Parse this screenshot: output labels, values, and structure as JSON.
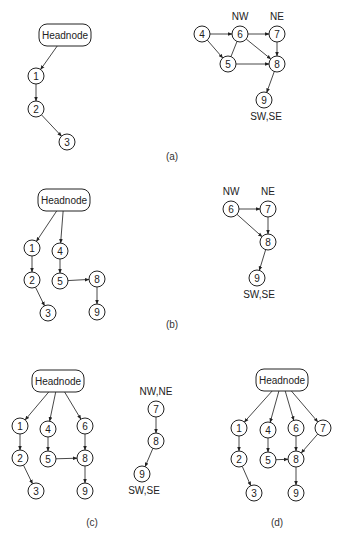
{
  "panels": [
    {
      "id": "a",
      "caption": "(a)",
      "graphs": [
        {
          "nodes": [
            {
              "id": "H",
              "label": "Headnode",
              "type": "head"
            },
            {
              "id": "1",
              "label": "1"
            },
            {
              "id": "2",
              "label": "2"
            },
            {
              "id": "3",
              "label": "3"
            }
          ],
          "edges": [
            [
              "H",
              "1",
              true
            ],
            [
              "1",
              "2",
              true
            ],
            [
              "2",
              "3",
              true
            ]
          ]
        },
        {
          "nodes": [
            {
              "id": "4",
              "label": "4"
            },
            {
              "id": "6",
              "label": "6",
              "tag": "NW"
            },
            {
              "id": "7",
              "label": "7",
              "tag": "NE"
            },
            {
              "id": "5",
              "label": "5"
            },
            {
              "id": "8",
              "label": "8"
            },
            {
              "id": "9",
              "label": "9",
              "tag": "SW,SE"
            }
          ],
          "edges": [
            [
              "4",
              "6",
              true
            ],
            [
              "4",
              "5",
              true
            ],
            [
              "6",
              "7",
              true
            ],
            [
              "5",
              "6",
              false
            ],
            [
              "6",
              "8",
              true
            ],
            [
              "5",
              "8",
              true
            ],
            [
              "7",
              "8",
              true
            ],
            [
              "8",
              "9",
              true
            ]
          ]
        }
      ]
    },
    {
      "id": "b",
      "caption": "(b)",
      "graphs": [
        {
          "nodes": [
            {
              "id": "H",
              "label": "Headnode",
              "type": "head"
            },
            {
              "id": "1",
              "label": "1"
            },
            {
              "id": "4",
              "label": "4"
            },
            {
              "id": "2",
              "label": "2"
            },
            {
              "id": "5",
              "label": "5"
            },
            {
              "id": "8",
              "label": "8"
            },
            {
              "id": "3",
              "label": "3"
            },
            {
              "id": "9",
              "label": "9"
            }
          ],
          "edges": [
            [
              "H",
              "1",
              true
            ],
            [
              "H",
              "4",
              true
            ],
            [
              "1",
              "2",
              true
            ],
            [
              "2",
              "3",
              true
            ],
            [
              "4",
              "5",
              true
            ],
            [
              "5",
              "8",
              true
            ],
            [
              "8",
              "9",
              true
            ]
          ]
        },
        {
          "nodes": [
            {
              "id": "6",
              "label": "6",
              "tag": "NW"
            },
            {
              "id": "7",
              "label": "7",
              "tag": "NE"
            },
            {
              "id": "8",
              "label": "8"
            },
            {
              "id": "9",
              "label": "9",
              "tag": "SW,SE"
            }
          ],
          "edges": [
            [
              "6",
              "7",
              true
            ],
            [
              "6",
              "8",
              true
            ],
            [
              "7",
              "8",
              true
            ],
            [
              "8",
              "9",
              true
            ]
          ]
        }
      ]
    },
    {
      "id": "c",
      "caption": "(c)",
      "graphs": [
        {
          "nodes": [
            {
              "id": "H",
              "label": "Headnode",
              "type": "head"
            },
            {
              "id": "1",
              "label": "1"
            },
            {
              "id": "4",
              "label": "4"
            },
            {
              "id": "6",
              "label": "6"
            },
            {
              "id": "2",
              "label": "2"
            },
            {
              "id": "5",
              "label": "5"
            },
            {
              "id": "8",
              "label": "8"
            },
            {
              "id": "3",
              "label": "3"
            },
            {
              "id": "9",
              "label": "9"
            }
          ],
          "edges": [
            [
              "H",
              "1",
              true
            ],
            [
              "H",
              "4",
              true
            ],
            [
              "H",
              "6",
              true
            ],
            [
              "1",
              "2",
              true
            ],
            [
              "2",
              "3",
              true
            ],
            [
              "4",
              "5",
              true
            ],
            [
              "5",
              "8",
              true
            ],
            [
              "6",
              "8",
              true
            ],
            [
              "8",
              "9",
              true
            ]
          ]
        },
        {
          "nodes": [
            {
              "id": "7",
              "label": "7",
              "tag": "NW,NE"
            },
            {
              "id": "8",
              "label": "8"
            },
            {
              "id": "9",
              "label": "9",
              "tag": "SW,SE"
            }
          ],
          "edges": [
            [
              "7",
              "8",
              true
            ],
            [
              "8",
              "9",
              true
            ]
          ]
        }
      ]
    },
    {
      "id": "d",
      "caption": "(d)",
      "graphs": [
        {
          "nodes": [
            {
              "id": "H",
              "label": "Headnode",
              "type": "head"
            },
            {
              "id": "1",
              "label": "1"
            },
            {
              "id": "4",
              "label": "4"
            },
            {
              "id": "6",
              "label": "6"
            },
            {
              "id": "7",
              "label": "7"
            },
            {
              "id": "2",
              "label": "2"
            },
            {
              "id": "5",
              "label": "5"
            },
            {
              "id": "8",
              "label": "8"
            },
            {
              "id": "3",
              "label": "3"
            },
            {
              "id": "9",
              "label": "9"
            }
          ],
          "edges": [
            [
              "H",
              "1",
              true
            ],
            [
              "H",
              "4",
              true
            ],
            [
              "H",
              "6",
              true
            ],
            [
              "H",
              "7",
              true
            ],
            [
              "1",
              "2",
              true
            ],
            [
              "2",
              "3",
              true
            ],
            [
              "4",
              "5",
              true
            ],
            [
              "5",
              "8",
              true
            ],
            [
              "6",
              "8",
              true
            ],
            [
              "7",
              "8",
              true
            ],
            [
              "8",
              "9",
              true
            ]
          ]
        }
      ]
    }
  ]
}
